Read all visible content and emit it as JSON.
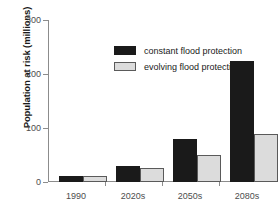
{
  "chart_data": {
    "type": "bar",
    "title": "",
    "xlabel": "",
    "ylabel": "Population at risk (millions)",
    "categories": [
      "1990",
      "2020s",
      "2050s",
      "2080s"
    ],
    "series": [
      {
        "name": "constant flood protection",
        "color": "#1a1a1a",
        "values": [
          12,
          30,
          80,
          225
        ]
      },
      {
        "name": "evolving flood protection",
        "color": "#dcdcdc",
        "values": [
          12,
          26,
          50,
          88
        ]
      }
    ],
    "ylim": [
      0,
      300
    ],
    "yticks": [
      0,
      100,
      200,
      300
    ],
    "ytick_labels": [
      "0",
      "100",
      "200",
      "300"
    ],
    "grid": false,
    "legend_position": "upper-left-inside"
  },
  "axes": {
    "y_title": "Population at risk (millions)",
    "y_tick_0": "0",
    "y_tick_1": "100",
    "y_tick_2": "200",
    "y_tick_3": "300",
    "x_tick_0": "1990",
    "x_tick_1": "2020s",
    "x_tick_2": "2050s",
    "x_tick_3": "2080s"
  },
  "legend": {
    "entries": [
      {
        "label": "constant flood protection",
        "swatch": "constant"
      },
      {
        "label": "evolving flood protection",
        "swatch": "evolving"
      }
    ]
  }
}
